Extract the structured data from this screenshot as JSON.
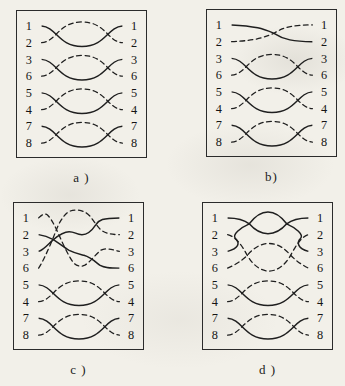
{
  "figure": {
    "background": "#f2f0e9",
    "line_color": "#1f1f1f",
    "panels": [
      {
        "id": "a",
        "caption": "a )",
        "left_labels": [
          "1",
          "2",
          "3",
          "6",
          "5",
          "4",
          "7",
          "8"
        ],
        "right_labels": [
          "1",
          "2",
          "3",
          "6",
          "5",
          "4",
          "7",
          "8"
        ],
        "wires": [
          {
            "pattern": "twist",
            "solid_row": 0,
            "dashed_row": 1
          },
          {
            "pattern": "twist",
            "solid_row": 2,
            "dashed_row": 3
          },
          {
            "pattern": "twist",
            "solid_row": 4,
            "dashed_row": 5
          },
          {
            "pattern": "twist",
            "solid_row": 6,
            "dashed_row": 7
          }
        ]
      },
      {
        "id": "b",
        "caption": "b)",
        "left_labels": [
          "1",
          "2",
          "3",
          "6",
          "5",
          "4",
          "7",
          "8"
        ],
        "right_labels": [
          "1",
          "2",
          "3",
          "6",
          "5",
          "4",
          "7",
          "8"
        ],
        "wires": [
          {
            "pattern": "cross",
            "solid_row": 0,
            "dashed_row": 1
          },
          {
            "pattern": "twist",
            "solid_row": 2,
            "dashed_row": 3
          },
          {
            "pattern": "twist",
            "solid_row": 4,
            "dashed_row": 5
          },
          {
            "pattern": "twist",
            "solid_row": 6,
            "dashed_row": 7
          }
        ]
      },
      {
        "id": "c",
        "caption": "c )",
        "left_labels": [
          "1",
          "2",
          "3",
          "6",
          "5",
          "4",
          "7",
          "8"
        ],
        "right_labels": [
          "1",
          "2",
          "3",
          "6",
          "5",
          "4",
          "7",
          "8"
        ],
        "wires": [
          {
            "pattern": "path",
            "style": "solid",
            "d": "M 25 49 C 31 47, 35 41, 40 37 C 46 32, 51 29, 56 29 C 62 29, 63 32, 69 32 C 75 32, 79 28, 83 22 C 86 17, 90 15, 107 15"
          },
          {
            "pattern": "path",
            "style": "solid",
            "d": "M 25 32 C 31 33, 36 35, 40 37 C 46 41, 51 45, 56 48 C 62 51, 67 52, 71 53 C 78 55, 82 59, 87 63 C 92 66, 98 66, 107 66"
          },
          {
            "pattern": "path",
            "style": "dashed",
            "d": "M 25 15 C 28 12, 31 10, 34 12 C 38 16, 42 24, 46 33 C 50 42, 55 53, 60 60 C 63 64, 68 65, 72 63 C 77 60, 82 53, 88 48 C 93 45, 99 47, 107 49"
          },
          {
            "pattern": "path",
            "style": "dashed",
            "d": "M 25 66 C 29 60, 33 51, 37 42 C 41 33, 44 23, 48 17 C 52 11, 56 7, 62 7 C 69 7, 73 9, 77 13 C 81 18, 84 23, 88 27 C 93 31, 99 32, 107 32"
          },
          {
            "pattern": "twist",
            "solid_row": 4,
            "dashed_row": 5
          },
          {
            "pattern": "twist",
            "solid_row": 6,
            "dashed_row": 7
          }
        ]
      },
      {
        "id": "d",
        "caption": "d )",
        "left_labels": [
          "1",
          "2",
          "3",
          "6",
          "5",
          "4",
          "7",
          "8"
        ],
        "right_labels": [
          "1",
          "2",
          "3",
          "6",
          "5",
          "4",
          "7",
          "8"
        ],
        "wires": [
          {
            "pattern": "path",
            "style": "solid",
            "d": "M 25 15 C 36 15, 42 17, 47 21 C 53 28, 60 31, 66 31 C 72 31, 79 28, 85 21 C 90 17, 96 15, 107 15"
          },
          {
            "pattern": "path",
            "style": "solid",
            "d": "M 25 49 C 36 46, 38 41, 33 36 C 29 32, 38 25, 47 21 C 53 13, 59 9, 66 9 C 73 9, 79 13, 85 21 C 94 25, 103 32, 99 36 C 95 40, 96 46, 107 49"
          },
          {
            "pattern": "path",
            "style": "dashed",
            "d": "M 25 32 C 33 34, 39 42, 45 53 C 50 62, 58 69, 67 69 C 76 69, 84 62, 89 53 C 95 42, 100 34, 107 32"
          },
          {
            "pattern": "path",
            "style": "dashed",
            "d": "M 25 66 C 32 63, 39 59, 45 53 C 51 46, 58 41, 67 41 C 76 41, 83 46, 89 53 C 95 59, 101 63, 107 66"
          },
          {
            "pattern": "twist",
            "solid_row": 4,
            "dashed_row": 5
          },
          {
            "pattern": "twist",
            "solid_row": 6,
            "dashed_row": 7
          }
        ]
      }
    ]
  }
}
